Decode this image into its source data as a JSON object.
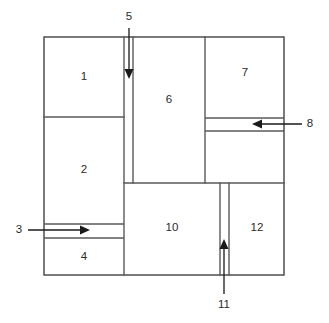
{
  "diagram": {
    "type": "floor-plan-schematic",
    "canvas": {
      "width": 329,
      "height": 323
    },
    "colors": {
      "wall": "#595959",
      "arrow": "#1a1a1a",
      "label": "#2b2b2b",
      "background": "#ffffff"
    },
    "outer_boundary": {
      "x": 44,
      "y": 37,
      "width": 240,
      "height": 238
    },
    "rooms": [
      {
        "id": "room-1",
        "label": "1",
        "cx": 84,
        "cy": 77,
        "x": 44,
        "y": 37,
        "width": 80,
        "height": 80
      },
      {
        "id": "room-2",
        "label": "2",
        "cx": 84,
        "cy": 170,
        "x": 44,
        "y": 117,
        "width": 80,
        "height": 107
      },
      {
        "id": "room-4",
        "label": "4",
        "cx": 84,
        "cy": 257,
        "x": 44,
        "y": 238,
        "width": 80,
        "height": 37
      },
      {
        "id": "room-6",
        "label": "6",
        "cx": 169,
        "cy": 100,
        "x": 133,
        "y": 37,
        "width": 72,
        "height": 146
      },
      {
        "id": "room-7",
        "label": "7",
        "cx": 245,
        "cy": 73,
        "x": 205,
        "y": 37,
        "width": 79,
        "height": 81
      },
      {
        "id": "room-10",
        "label": "10",
        "cx": 172,
        "cy": 228,
        "x": 124,
        "y": 183,
        "width": 96,
        "height": 92
      },
      {
        "id": "room-12",
        "label": "12",
        "cx": 257,
        "cy": 228,
        "x": 229,
        "y": 183,
        "width": 55,
        "height": 92
      }
    ],
    "flows": [
      {
        "id": "flow-3",
        "label": "3",
        "direction": "right",
        "label_x": 19,
        "label_y": 230,
        "channel": {
          "orientation": "horizontal",
          "y_top": 224,
          "y_bottom": 238,
          "x_start": 44,
          "x_end": 124
        },
        "arrow": {
          "x1": 28,
          "y1": 230,
          "x2": 89,
          "y2": 230
        }
      },
      {
        "id": "flow-5",
        "label": "5",
        "direction": "down",
        "label_x": 129,
        "label_y": 17,
        "channel": {
          "orientation": "vertical",
          "x_left": 124,
          "x_right": 133,
          "y_start": 37,
          "y_end": 183
        },
        "arrow": {
          "x1": 129,
          "y1": 28,
          "x2": 129,
          "y2": 78
        }
      },
      {
        "id": "flow-8",
        "label": "8",
        "direction": "left",
        "label_x": 310,
        "label_y": 124,
        "channel": {
          "orientation": "horizontal",
          "y_top": 118,
          "y_bottom": 131,
          "x_start": 205,
          "x_end": 284
        },
        "arrow": {
          "x1": 302,
          "y1": 124,
          "x2": 253,
          "y2": 124
        }
      },
      {
        "id": "flow-11",
        "label": "11",
        "direction": "up",
        "label_x": 224,
        "label_y": 305,
        "channel": {
          "orientation": "vertical",
          "x_left": 220,
          "x_right": 229,
          "y_start": 183,
          "y_end": 275
        },
        "arrow": {
          "x1": 224,
          "y1": 294,
          "x2": 224,
          "y2": 240
        }
      }
    ]
  }
}
